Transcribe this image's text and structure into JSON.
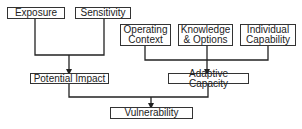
{
  "diagram": {
    "nodes": [
      {
        "id": "exposure",
        "label": "Exposure"
      },
      {
        "id": "sensitivity",
        "label": "Sensitivity"
      },
      {
        "id": "operating_context",
        "label": "Operating Context"
      },
      {
        "id": "knowledge_options",
        "label": "Knowledge & Options"
      },
      {
        "id": "individual_capability",
        "label": "Individual Capability"
      },
      {
        "id": "potential_impact",
        "label": "Potential Impact"
      },
      {
        "id": "adaptive_capacity",
        "label": "Adaptive Capacity"
      },
      {
        "id": "vulnerability",
        "label": "Vulnerability"
      }
    ],
    "edges": [
      {
        "from": [
          "exposure",
          "sensitivity"
        ],
        "to": "potential_impact"
      },
      {
        "from": [
          "operating_context",
          "knowledge_options",
          "individual_capability"
        ],
        "to": "adaptive_capacity"
      },
      {
        "from": [
          "potential_impact",
          "adaptive_capacity"
        ],
        "to": "vulnerability"
      }
    ]
  }
}
